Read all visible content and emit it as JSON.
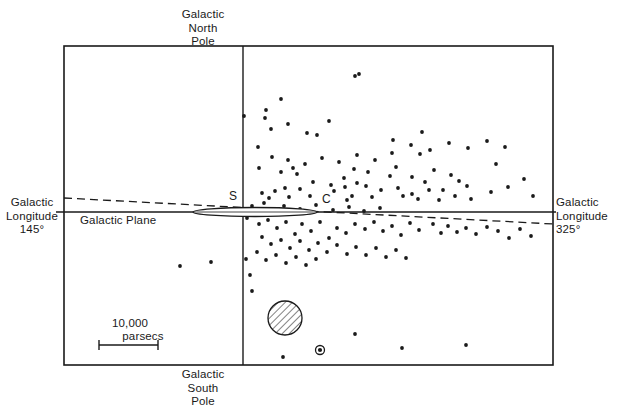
{
  "figure": {
    "title_absent": true,
    "width": 619,
    "height": 413,
    "background_color": "#ffffff",
    "ink_color": "#1a1a1a"
  },
  "labels": {
    "north_pole": "Galactic\nNorth\nPole",
    "south_pole": "Galactic\nSouth\nPole",
    "longitude_left": "Galactic\nLongitude\n145°",
    "longitude_right": "Galactic\nLongitude\n325°",
    "galactic_plane": "Galactic Plane",
    "sun_marker": "S",
    "center_marker": "C",
    "scale_value": "10,000",
    "scale_unit": "parsecs"
  },
  "chart_data": {
    "type": "scatter",
    "title": "",
    "xlabel": "Galactic Longitude 145° — 325°",
    "ylabel": "Galactic North Pole — Galactic South Pole",
    "grid": false,
    "legend": "none",
    "frame": {
      "x0": 64,
      "y0": 46,
      "x1": 553,
      "y1": 365
    },
    "axes": {
      "vertical_axis_x": 243,
      "horizontal_axis_y": 212,
      "vertical_axis_label_top": "Galactic North Pole",
      "vertical_axis_label_bottom": "Galactic South Pole",
      "horizontal_axis_label_left": "Galactic Longitude 145°",
      "horizontal_axis_label_right": "Galactic Longitude 325°"
    },
    "scale_bar": {
      "label": "10,000 parsecs",
      "value": 10000,
      "unit": "parsecs",
      "x_start": 99,
      "x_end": 158,
      "y": 345
    },
    "annotations": [
      {
        "name": "sun",
        "symbol": "S",
        "x": 243,
        "y": 212,
        "text_x": 232,
        "text_y": 199
      },
      {
        "name": "galactic-center",
        "symbol": "C",
        "x": 330,
        "y": 212,
        "text_x": 325,
        "text_y": 202
      }
    ],
    "overlays": [
      {
        "name": "galactic-disk-lens",
        "shape": "ellipse",
        "cx": 255,
        "cy": 212,
        "rx": 62,
        "ry": 4.5,
        "fill": "#ffffff",
        "stroke": "#1a1a1a"
      },
      {
        "name": "hatched-cloud",
        "shape": "circle-hatched",
        "cx": 285,
        "cy": 318,
        "r": 17,
        "hatch_angle_deg": 45,
        "stroke": "#1a1a1a"
      },
      {
        "name": "circled-dot-object",
        "shape": "circle-with-dot",
        "cx": 320,
        "cy": 350,
        "r": 4.5,
        "stroke": "#1a1a1a"
      },
      {
        "name": "dashed-reference-line",
        "shape": "dashed-line",
        "x1": 64,
        "y1": 198,
        "x2": 553,
        "y2": 224,
        "dash": "8,5"
      }
    ],
    "points": [
      [
        244,
        116
      ],
      [
        355,
        76
      ],
      [
        281,
        99
      ],
      [
        266,
        110
      ],
      [
        265,
        118
      ],
      [
        317,
        135
      ],
      [
        258,
        147
      ],
      [
        293,
        168
      ],
      [
        297,
        174
      ],
      [
        359,
        74
      ],
      [
        281,
        172
      ],
      [
        354,
        169
      ],
      [
        285,
        188
      ],
      [
        392,
        153
      ],
      [
        422,
        132
      ],
      [
        420,
        154
      ],
      [
        459,
        181
      ],
      [
        496,
        164
      ],
      [
        300,
        189
      ],
      [
        313,
        182
      ],
      [
        331,
        185
      ],
      [
        345,
        187
      ],
      [
        368,
        172
      ],
      [
        381,
        190
      ],
      [
        390,
        176
      ],
      [
        398,
        188
      ],
      [
        412,
        177
      ],
      [
        425,
        182
      ],
      [
        434,
        170
      ],
      [
        443,
        190
      ],
      [
        455,
        196
      ],
      [
        467,
        186
      ],
      [
        412,
        194
      ],
      [
        372,
        197
      ],
      [
        352,
        196
      ],
      [
        310,
        196
      ],
      [
        289,
        197
      ],
      [
        275,
        191
      ],
      [
        269,
        198
      ],
      [
        334,
        191
      ],
      [
        344,
        178
      ],
      [
        347,
        200
      ],
      [
        357,
        183
      ],
      [
        366,
        186
      ],
      [
        396,
        167
      ],
      [
        403,
        196
      ],
      [
        418,
        199
      ],
      [
        429,
        190
      ],
      [
        439,
        200
      ],
      [
        451,
        175
      ],
      [
        471,
        199
      ],
      [
        491,
        192
      ],
      [
        508,
        187
      ],
      [
        524,
        179
      ],
      [
        533,
        196
      ],
      [
        264,
        203
      ],
      [
        252,
        206
      ],
      [
        247,
        218
      ],
      [
        259,
        224
      ],
      [
        268,
        220
      ],
      [
        277,
        228
      ],
      [
        286,
        222
      ],
      [
        295,
        234
      ],
      [
        302,
        224
      ],
      [
        311,
        231
      ],
      [
        320,
        222
      ],
      [
        329,
        238
      ],
      [
        337,
        228
      ],
      [
        346,
        233
      ],
      [
        355,
        224
      ],
      [
        365,
        229
      ],
      [
        374,
        222
      ],
      [
        383,
        231
      ],
      [
        392,
        226
      ],
      [
        401,
        235
      ],
      [
        410,
        223
      ],
      [
        419,
        230
      ],
      [
        433,
        224
      ],
      [
        441,
        233
      ],
      [
        448,
        226
      ],
      [
        457,
        232
      ],
      [
        466,
        228
      ],
      [
        476,
        234
      ],
      [
        487,
        227
      ],
      [
        498,
        231
      ],
      [
        509,
        238
      ],
      [
        520,
        229
      ],
      [
        531,
        236
      ],
      [
        262,
        237
      ],
      [
        271,
        244
      ],
      [
        281,
        240
      ],
      [
        290,
        248
      ],
      [
        300,
        241
      ],
      [
        309,
        250
      ],
      [
        318,
        243
      ],
      [
        327,
        252
      ],
      [
        337,
        245
      ],
      [
        347,
        254
      ],
      [
        356,
        247
      ],
      [
        366,
        255
      ],
      [
        376,
        248
      ],
      [
        386,
        257
      ],
      [
        396,
        250
      ],
      [
        406,
        258
      ],
      [
        257,
        252
      ],
      [
        266,
        260
      ],
      [
        276,
        255
      ],
      [
        286,
        263
      ],
      [
        296,
        257
      ],
      [
        306,
        265
      ],
      [
        316,
        259
      ],
      [
        180,
        266
      ],
      [
        211,
        262
      ],
      [
        246,
        259
      ],
      [
        250,
        275
      ],
      [
        252,
        291
      ],
      [
        283,
        357
      ],
      [
        355,
        334
      ],
      [
        402,
        348
      ],
      [
        466,
        345
      ],
      [
        259,
        168
      ],
      [
        272,
        157
      ],
      [
        288,
        160
      ],
      [
        305,
        164
      ],
      [
        322,
        158
      ],
      [
        339,
        162
      ],
      [
        357,
        155
      ],
      [
        375,
        160
      ],
      [
        393,
        140
      ],
      [
        411,
        145
      ],
      [
        430,
        150
      ],
      [
        449,
        143
      ],
      [
        468,
        148
      ],
      [
        487,
        141
      ],
      [
        505,
        147
      ],
      [
        271,
        129
      ],
      [
        288,
        124
      ],
      [
        307,
        133
      ],
      [
        329,
        121
      ],
      [
        262,
        193
      ],
      [
        284,
        206
      ],
      [
        300,
        209
      ],
      [
        316,
        205
      ],
      [
        333,
        210
      ],
      [
        349,
        207
      ],
      [
        364,
        211
      ],
      [
        380,
        208
      ]
    ],
    "point_color": "#1a1a1a",
    "point_radius": 1.9,
    "n_points": 148
  }
}
